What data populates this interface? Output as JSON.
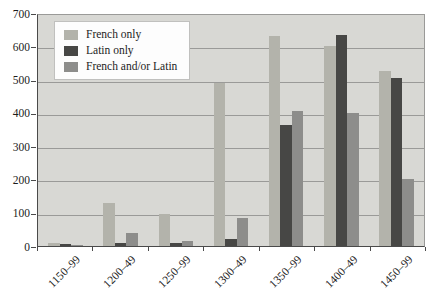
{
  "chart_data": {
    "type": "bar",
    "title": "",
    "categories": [
      "1150–99",
      "1200–49",
      "1250–99",
      "1300–49",
      "1350–99",
      "1400–49",
      "1450–99"
    ],
    "series": [
      {
        "name": "French only",
        "color": "#b3b3ab",
        "values": [
          10,
          130,
          95,
          490,
          630,
          600,
          525
        ]
      },
      {
        "name": "Latin only",
        "color": "#474745",
        "values": [
          6,
          10,
          8,
          20,
          365,
          635,
          505
        ]
      },
      {
        "name": "French and/or Latin",
        "color": "#8d8d8b",
        "values": [
          4,
          40,
          15,
          85,
          405,
          400,
          200
        ]
      }
    ],
    "xlabel": "",
    "ylabel": "",
    "ylim": [
      0,
      700
    ],
    "yticks": [
      0,
      100,
      200,
      300,
      400,
      500,
      600,
      700
    ],
    "grid": true,
    "legend_position": "top-left"
  },
  "colors": {
    "page_background": "#ffffff",
    "plot_background": "#d8d8d4",
    "gridline": "#9a9a98",
    "axis": "#4a4a4a",
    "legend_border": "#c0c0be",
    "legend_background": "#fdfdfd"
  }
}
